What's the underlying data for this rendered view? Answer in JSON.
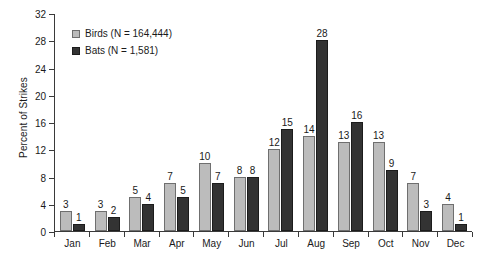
{
  "chart_data": {
    "type": "bar",
    "title": "",
    "xlabel": "",
    "ylabel": "Percent of Strikes",
    "ylim": [
      0,
      32
    ],
    "ytick_step": 4,
    "yticks": [
      0,
      4,
      8,
      12,
      16,
      20,
      24,
      28,
      32
    ],
    "grid": false,
    "legend_position": "top-left",
    "categories": [
      "Jan",
      "Feb",
      "Mar",
      "Apr",
      "May",
      "Jun",
      "Jul",
      "Aug",
      "Sep",
      "Oct",
      "Nov",
      "Dec"
    ],
    "series": [
      {
        "name": "Birds (N = 164,444)",
        "short_name": "Birds",
        "sample_size": "164,444",
        "color": "#bcbcbc",
        "values": [
          3,
          3,
          5,
          7,
          10,
          8,
          12,
          14,
          13,
          13,
          7,
          4
        ]
      },
      {
        "name": "Bats (N = 1,581)",
        "short_name": "Bats",
        "sample_size": "1,581",
        "color": "#333333",
        "values": [
          1,
          2,
          4,
          5,
          7,
          8,
          15,
          28,
          16,
          9,
          3,
          1
        ]
      }
    ]
  },
  "legend": {
    "items": [
      {
        "label": "Birds (N = 164,444)"
      },
      {
        "label": "Bats (N = 1,581)"
      }
    ]
  },
  "caption": {
    "text": ""
  }
}
